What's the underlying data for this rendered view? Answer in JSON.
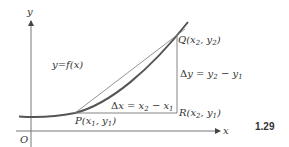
{
  "figure": {
    "number": "1.29",
    "axes": {
      "x_label": "x",
      "y_label": "y",
      "origin_label": "O"
    },
    "curve_label": "y=f(x)",
    "points": {
      "P": {
        "name": "P",
        "coords": "(x1, y1)"
      },
      "Q": {
        "name": "Q",
        "coords": "(x2, y2)"
      },
      "R": {
        "name": "R",
        "coords": "(x2, y1)"
      }
    },
    "increments": {
      "delta_x": "Δx = x2 − x1",
      "delta_y": "Δy = y2 − y1"
    },
    "colors": {
      "curve": "#555555",
      "lines": "#777777",
      "text": "#333333"
    }
  }
}
